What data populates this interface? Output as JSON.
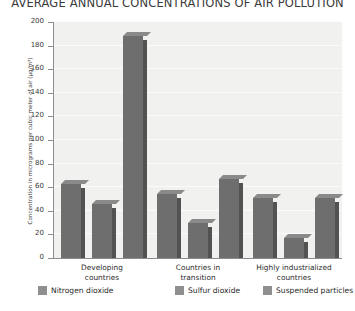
{
  "chart_data": {
    "type": "bar",
    "title": "AVERAGE ANNUAL CONCENTRATIONS OF AIR POLLUTION",
    "xlabel": "",
    "ylabel": "Concentration in micrograms per cubic meter of air (µg/m³)",
    "categories": [
      "Developing countries",
      "Countries in transition",
      "Highly industrialized countries"
    ],
    "category_lines": [
      [
        "Developing",
        "countries"
      ],
      [
        "Countries in",
        "transition"
      ],
      [
        "Highly industrialized",
        "countries"
      ]
    ],
    "series": [
      {
        "name": "Nitrogen dioxide",
        "values": [
          63,
          54,
          51
        ],
        "color": "#6e6e6e"
      },
      {
        "name": "Sulfur dioxide",
        "values": [
          46,
          30,
          17
        ],
        "color": "#6e6e6e"
      },
      {
        "name": "Suspended particles",
        "values": [
          188,
          67,
          51
        ],
        "color": "#6e6e6e"
      }
    ],
    "ylim": [
      0,
      200
    ],
    "yticks": [
      0,
      20,
      40,
      60,
      80,
      100,
      120,
      140,
      160,
      180,
      200
    ],
    "ytick_labels": [
      "0",
      "20",
      "40",
      "60",
      "80",
      "100",
      "120",
      "140",
      "160",
      "180",
      "200"
    ],
    "grid": true,
    "legend_position": "bottom",
    "plot_background": "#f1f1ef",
    "gridline_color": "#fbfbfa",
    "axis_color": "#8d8d8d"
  }
}
